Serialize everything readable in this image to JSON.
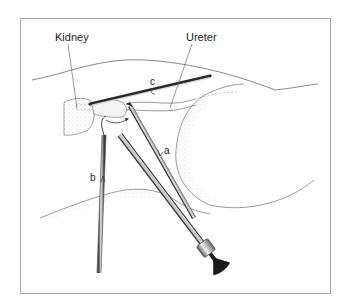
{
  "figure": {
    "labels": {
      "kidney": "Kidney",
      "ureter": "Ureter",
      "instrument_a": "a",
      "instrument_b": "b",
      "instrument_c": "c"
    },
    "colors": {
      "frame": "#a8a8a8",
      "outline": "#555555",
      "stipple": "#bdbdbd",
      "instrument_light": "#d0d0d0",
      "instrument_dark": "#2a2a2a",
      "background": "#ffffff"
    }
  }
}
